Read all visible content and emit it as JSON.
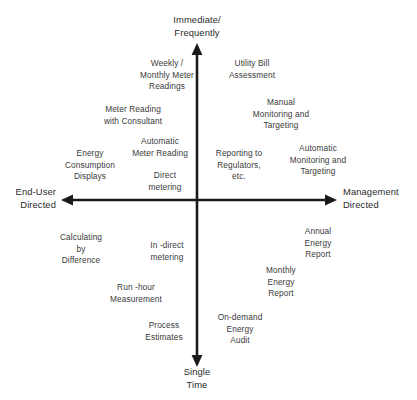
{
  "diagram": {
    "type": "two-axis-quadrant-matrix",
    "axes": {
      "vertical": {
        "top_label": "Immediate/\nFrequently",
        "bottom_label": "Single\nTime",
        "x": 197,
        "y_top": 44,
        "y_bottom": 366
      },
      "horizontal": {
        "left_label": "End-User\nDirected",
        "right_label": "Management\nDirected",
        "y": 200,
        "x_left": 62,
        "x_right": 336
      },
      "color": "#1a1a1a"
    },
    "items": [
      {
        "text": "Weekly /\nMonthly Meter\nReadings",
        "x": 167,
        "y": 58,
        "quadrant": "upper-left"
      },
      {
        "text": "Utility Bill\nAssessment",
        "x": 252,
        "y": 58,
        "quadrant": "upper-right"
      },
      {
        "text": "Meter Reading\nwith Consultant",
        "x": 133,
        "y": 104,
        "quadrant": "upper-left"
      },
      {
        "text": "Manual\nMonitoring and\nTargeting",
        "x": 281,
        "y": 97,
        "quadrant": "upper-right"
      },
      {
        "text": "Automatic\nMeter Reading",
        "x": 160,
        "y": 136,
        "quadrant": "upper-left"
      },
      {
        "text": "Energy\nConsumption\nDisplays",
        "x": 90,
        "y": 148,
        "quadrant": "upper-left"
      },
      {
        "text": "Reporting to\nRegulators,\netc.",
        "x": 239,
        "y": 148,
        "quadrant": "upper-right"
      },
      {
        "text": "Automatic\nMonitoring and\nTargeting",
        "x": 318,
        "y": 143,
        "quadrant": "upper-right"
      },
      {
        "text": "Direct\nmetering",
        "x": 165,
        "y": 170,
        "quadrant": "upper-left"
      },
      {
        "text": "Calculating\nby\nDifference",
        "x": 81,
        "y": 232,
        "quadrant": "lower-left"
      },
      {
        "text": "In -direct\nmetering",
        "x": 167,
        "y": 240,
        "quadrant": "lower-left"
      },
      {
        "text": "Annual\nEnergy\nReport",
        "x": 318,
        "y": 226,
        "quadrant": "lower-right"
      },
      {
        "text": "Monthly\nEnergy\nReport",
        "x": 281,
        "y": 265,
        "quadrant": "lower-right"
      },
      {
        "text": "Run -hour\nMeasurement",
        "x": 136,
        "y": 282,
        "quadrant": "lower-left"
      },
      {
        "text": "Process\nEstimates",
        "x": 164,
        "y": 320,
        "quadrant": "lower-left"
      },
      {
        "text": "On-demand\nEnergy\nAudit",
        "x": 240,
        "y": 312,
        "quadrant": "lower-right"
      }
    ]
  }
}
